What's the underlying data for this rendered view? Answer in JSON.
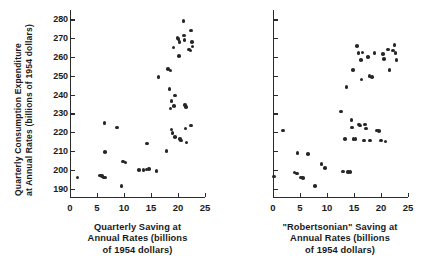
{
  "figure": {
    "y_axis_title_line1": "Quarterly Consumption Expenditure",
    "y_axis_title_line2": "at Annual Rates (billions of 1954 dollars)",
    "point_color": "#272727",
    "axis_color": "#2b2b2b",
    "background": "#ffffff"
  },
  "panels": {
    "left": {
      "caption_line1": "Quarterly Saving at",
      "caption_line2": "Annual Rates (billions",
      "caption_line3": "of 1954 dollars)",
      "x_tick_labels": [
        "0",
        "5",
        "10",
        "15",
        "20",
        "25"
      ],
      "y_tick_labels": [
        "190",
        "200",
        "210",
        "220",
        "230",
        "240",
        "250",
        "260",
        "270",
        "280"
      ]
    },
    "right": {
      "caption_line1": "\"Robertsonian\" Saving at",
      "caption_line2": "Annual Rates (billions",
      "caption_line3": "of 1954 dollars)",
      "x_tick_labels": [
        "0",
        "5",
        "10",
        "15",
        "20",
        "25"
      ],
      "y_tick_labels": []
    }
  },
  "chart_data": [
    {
      "type": "scatter",
      "panel": "left",
      "title": "",
      "xlabel": "Quarterly Saving at Annual Rates (billions of 1954 dollars)",
      "ylabel": "Quarterly Consumption Expenditure at Annual Rates (billions of 1954 dollars)",
      "xlim": [
        0,
        25
      ],
      "ylim": [
        185,
        285
      ],
      "xticks": [
        0,
        5,
        10,
        15,
        20,
        25
      ],
      "yticks": [
        190,
        200,
        210,
        220,
        230,
        240,
        250,
        260,
        270,
        280
      ],
      "grid": false,
      "legend": null,
      "points": [
        [
          1.4,
          196.0
        ],
        [
          5.6,
          197.0
        ],
        [
          5.9,
          196.6
        ],
        [
          6.2,
          195.8
        ],
        [
          6.5,
          196.0
        ],
        [
          6.4,
          225.0
        ],
        [
          6.5,
          209.5
        ],
        [
          8.7,
          222.5
        ],
        [
          9.8,
          204.5
        ],
        [
          10.3,
          203.8
        ],
        [
          9.5,
          191.3
        ],
        [
          12.8,
          200.0
        ],
        [
          13.6,
          200.0
        ],
        [
          14.2,
          200.2
        ],
        [
          14.6,
          200.4
        ],
        [
          14.3,
          214.0
        ],
        [
          16.0,
          199.5
        ],
        [
          16.4,
          249.5
        ],
        [
          17.9,
          210.0
        ],
        [
          18.2,
          253.5
        ],
        [
          18.6,
          252.8
        ],
        [
          18.4,
          243.0
        ],
        [
          18.8,
          236.5
        ],
        [
          18.6,
          232.5
        ],
        [
          18.8,
          221.5
        ],
        [
          19.0,
          219.5
        ],
        [
          19.2,
          265.0
        ],
        [
          19.4,
          239.5
        ],
        [
          19.3,
          234.0
        ],
        [
          19.4,
          217.5
        ],
        [
          19.9,
          270.0
        ],
        [
          20.1,
          269.5
        ],
        [
          20.3,
          268.0
        ],
        [
          20.2,
          260.5
        ],
        [
          20.4,
          216.5
        ],
        [
          20.6,
          215.5
        ],
        [
          21.0,
          279.0
        ],
        [
          21.1,
          271.5
        ],
        [
          21.2,
          269.0
        ],
        [
          21.3,
          234.5
        ],
        [
          21.5,
          233.5
        ],
        [
          21.4,
          222.0
        ],
        [
          21.6,
          214.5
        ],
        [
          22.0,
          264.0
        ],
        [
          22.3,
          263.5
        ],
        [
          22.4,
          274.0
        ],
        [
          22.6,
          268.0
        ],
        [
          22.7,
          265.5
        ],
        [
          22.4,
          223.5
        ]
      ]
    },
    {
      "type": "scatter",
      "panel": "right",
      "title": "",
      "xlabel": "\"Robertsonian\" Saving at Annual Rates (billions of 1954 dollars)",
      "ylabel": "Quarterly Consumption Expenditure at Annual Rates (billions of 1954 dollars)",
      "xlim": [
        0,
        25
      ],
      "ylim": [
        185,
        285
      ],
      "xticks": [
        0,
        5,
        10,
        15,
        20,
        25
      ],
      "yticks": [
        190,
        200,
        210,
        220,
        230,
        240,
        250,
        260,
        270,
        280
      ],
      "grid": false,
      "legend": null,
      "points": [
        [
          0.2,
          196.5
        ],
        [
          1.9,
          221.0
        ],
        [
          4.0,
          198.5
        ],
        [
          4.4,
          198.0
        ],
        [
          4.5,
          209.0
        ],
        [
          5.2,
          196.0
        ],
        [
          5.6,
          195.5
        ],
        [
          6.5,
          208.5
        ],
        [
          7.8,
          191.5
        ],
        [
          9.0,
          203.0
        ],
        [
          9.6,
          201.0
        ],
        [
          12.6,
          231.0
        ],
        [
          13.0,
          199.0
        ],
        [
          13.3,
          216.5
        ],
        [
          13.9,
          198.8
        ],
        [
          14.3,
          198.8
        ],
        [
          13.6,
          244.0
        ],
        [
          14.5,
          226.5
        ],
        [
          14.6,
          222.5
        ],
        [
          14.8,
          253.0
        ],
        [
          14.9,
          216.5
        ],
        [
          15.3,
          216.3
        ],
        [
          15.6,
          266.0
        ],
        [
          15.8,
          262.0
        ],
        [
          15.9,
          224.0
        ],
        [
          16.1,
          223.5
        ],
        [
          16.3,
          258.5
        ],
        [
          16.4,
          248.0
        ],
        [
          16.6,
          262.5
        ],
        [
          16.9,
          215.5
        ],
        [
          17.0,
          224.0
        ],
        [
          17.2,
          222.0
        ],
        [
          17.6,
          260.0
        ],
        [
          17.9,
          250.0
        ],
        [
          18.0,
          215.5
        ],
        [
          18.3,
          249.5
        ],
        [
          18.8,
          262.0
        ],
        [
          19.3,
          221.0
        ],
        [
          19.6,
          220.5
        ],
        [
          20.0,
          215.5
        ],
        [
          20.4,
          261.5
        ],
        [
          20.6,
          259.0
        ],
        [
          20.8,
          215.0
        ],
        [
          21.3,
          264.0
        ],
        [
          21.6,
          253.0
        ],
        [
          22.2,
          263.5
        ],
        [
          22.5,
          266.5
        ],
        [
          22.7,
          262.0
        ],
        [
          22.9,
          258.5
        ]
      ]
    }
  ]
}
